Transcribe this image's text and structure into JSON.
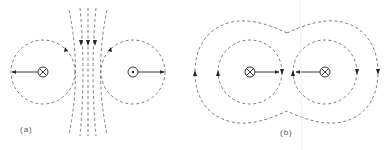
{
  "figure": {
    "panels": [
      {
        "id": "a",
        "label": "(a)",
        "description": "Two antiparallel currents: left into page (⊗), right out of page (⊙); field lines bunch between them; force vectors point outward (repulsion)",
        "conductors": [
          {
            "symbol": "⊗",
            "direction": "into-page",
            "force_arrow": "left"
          },
          {
            "symbol": "⊙",
            "direction": "out-of-page",
            "force_arrow": "right"
          }
        ]
      },
      {
        "id": "b",
        "label": "(b)",
        "description": "Two parallel currents both into page (⊗); enclosing field lines; force vectors point inward (attraction)",
        "conductors": [
          {
            "symbol": "⊗",
            "direction": "into-page",
            "force_arrow": "right"
          },
          {
            "symbol": "⊗",
            "direction": "into-page",
            "force_arrow": "left"
          }
        ]
      }
    ],
    "colors": {
      "line": "#6a6a6a",
      "arrow": "#2a2a2a",
      "background": "#ffffff"
    }
  }
}
